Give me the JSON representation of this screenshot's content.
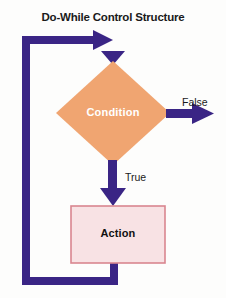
{
  "title": "Do-While Control Structure",
  "colors": {
    "background": "#fdfdfc",
    "arrow": "#3a2585",
    "condition_fill": "#f0a571",
    "condition_text": "#ffffff",
    "action_fill": "#f8e2e4",
    "action_border": "#d9868f",
    "action_text": "#111111",
    "title_text": "#1a1a1a",
    "edge_label_text": "#1a1a1a"
  },
  "nodes": {
    "condition": {
      "label": "Condition",
      "shape": "diamond"
    },
    "action": {
      "label": "Action",
      "shape": "rectangle"
    }
  },
  "edges": {
    "false_branch": {
      "label": "False",
      "from": "condition",
      "direction": "right"
    },
    "true_branch": {
      "label": "True",
      "from": "condition",
      "to": "action",
      "direction": "down"
    },
    "loop_back": {
      "label": "",
      "from": "action",
      "to": "condition",
      "direction": "left-up-right"
    },
    "entry": {
      "label": "",
      "to": "condition",
      "direction": "right"
    }
  }
}
